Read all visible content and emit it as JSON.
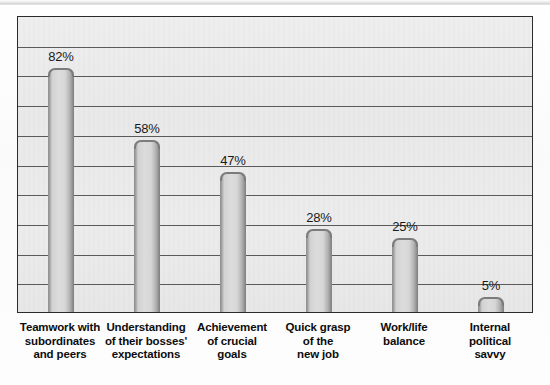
{
  "chart_data": {
    "type": "bar",
    "title": "",
    "subtitle": "",
    "xlabel": "",
    "ylabel": "",
    "ylim": [
      0,
      100
    ],
    "grid": true,
    "gridline_count": 9,
    "gridline_step": 10,
    "legend": "none",
    "value_suffix": "%",
    "categories": [
      "Teamwork with subordinates and peers",
      "Understanding of their bosses' expectations",
      "Achievement of crucial goals",
      "Quick grasp of the new job",
      "Work/life balance",
      "Internal political savvy"
    ],
    "category_lines": [
      [
        "Teamwork with",
        "subordinates",
        "and peers"
      ],
      [
        "Understanding",
        "of their bosses'",
        "expectations"
      ],
      [
        "Achievement",
        "of crucial",
        "goals"
      ],
      [
        "Quick grasp",
        "of the",
        "new job"
      ],
      [
        "Work/life",
        "balance"
      ],
      [
        "Internal",
        "political",
        "savvy"
      ]
    ],
    "values": [
      82,
      58,
      47,
      28,
      25,
      5
    ],
    "value_labels": [
      "82%",
      "58%",
      "47%",
      "28%",
      "25%",
      "5%"
    ],
    "colors": {
      "plot_background": "#ebebeb",
      "plot_border": "#2b2b2b",
      "gridline": "#3a3a3a",
      "bar_fill_light": "#dcdcdc",
      "bar_fill_dark": "#8a8a8a",
      "bar_edge": "#7b7b7b",
      "label_text": "#0d0d0d",
      "value_text": "#1a1a1a",
      "page_background": "#fdfdfd"
    }
  }
}
